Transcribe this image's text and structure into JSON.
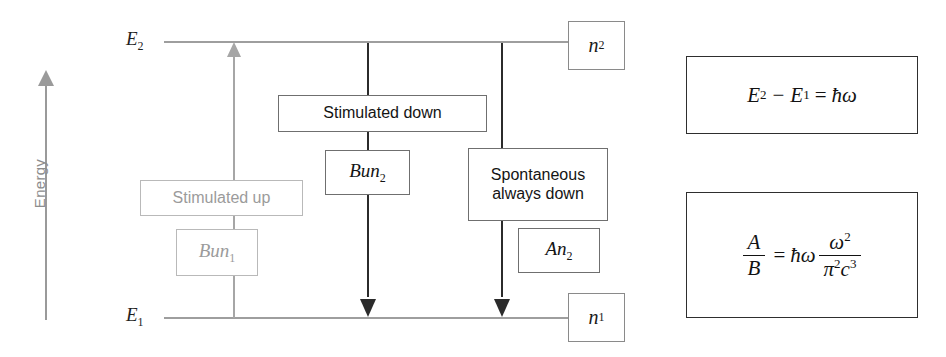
{
  "figure": {
    "axis": {
      "label": "Energy"
    },
    "levels": [
      {
        "id": "upper",
        "tag": "E",
        "tag_sub": "2",
        "population": "n",
        "population_sub": "2"
      },
      {
        "id": "lower",
        "tag": "E",
        "tag_sub": "1",
        "population": "n",
        "population_sub": "1"
      }
    ],
    "transitions": [
      {
        "id": "stimulated-up",
        "title": "Stimulated up",
        "rate": "Bun",
        "rate_sub": "1",
        "direction": "up",
        "color": "#9b9b9b"
      },
      {
        "id": "stimulated-down",
        "title": "Stimulated down",
        "rate": "Bun",
        "rate_sub": "2",
        "direction": "down",
        "color": "#141414"
      },
      {
        "id": "spontaneous-down",
        "title_line1": "Spontaneous",
        "title_line2": "always down",
        "rate": "An",
        "rate_sub": "2",
        "direction": "down",
        "color": "#141414"
      }
    ],
    "formulas": [
      {
        "id": "photon-energy",
        "lhs_a": "E",
        "lhs_a_sub": "2",
        "minus": "−",
        "lhs_b": "E",
        "lhs_b_sub": "1",
        "equals": "=",
        "rhs": "ħω"
      },
      {
        "id": "einstein-ab-ratio",
        "frac_num": "A",
        "frac_den": "B",
        "equals": "=",
        "hbar_omega": "ħω",
        "ratio_num": "ω",
        "ratio_num_sup": "2",
        "ratio_den_a": "π",
        "ratio_den_a_sup": "2",
        "ratio_den_b": "c",
        "ratio_den_b_sup": "3"
      }
    ]
  }
}
